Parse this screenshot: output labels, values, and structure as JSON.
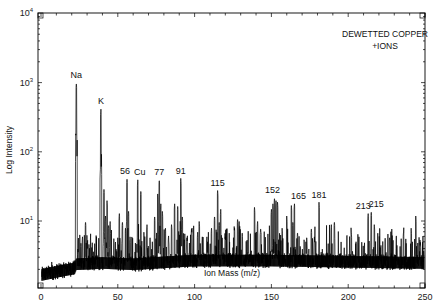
{
  "chart_data": {
    "type": "line",
    "title": "",
    "annotation": [
      "DEWETTED COPPER",
      "+IONS"
    ],
    "xlabel": "Ion Mass (m/z)",
    "ylabel": "Log Intensity",
    "xlim": [
      0,
      250
    ],
    "ylim_log10": [
      0,
      4
    ],
    "yscale": "log",
    "grid": false,
    "legend": null,
    "x_ticks": [
      0,
      50,
      100,
      150,
      200,
      250
    ],
    "x_tick_labels": [
      "0",
      "50",
      "100",
      "150",
      "200",
      "250"
    ],
    "y_ticks": [
      10,
      100,
      1000,
      10000
    ],
    "y_tick_labels": [
      "10¹",
      "10²",
      "10³",
      "10⁴"
    ],
    "baseline": [
      {
        "x": 0,
        "y": 1.6
      },
      {
        "x": 22,
        "y": 2.0
      },
      {
        "x": 23,
        "y": 2.3
      },
      {
        "x": 40,
        "y": 2.4
      },
      {
        "x": 60,
        "y": 2.3
      },
      {
        "x": 100,
        "y": 2.6
      },
      {
        "x": 150,
        "y": 2.6
      },
      {
        "x": 200,
        "y": 2.5
      },
      {
        "x": 250,
        "y": 2.4
      }
    ],
    "labeled_peaks": [
      {
        "label": "Na",
        "x": 23,
        "y": 1000
      },
      {
        "label": "K",
        "x": 39,
        "y": 420
      },
      {
        "label": "56",
        "x": 56,
        "y": 42
      },
      {
        "label": "Cu",
        "x": 63,
        "y": 40
      },
      {
        "label": "77",
        "x": 77,
        "y": 40
      },
      {
        "label": "91",
        "x": 91,
        "y": 42
      },
      {
        "label": "115",
        "x": 115,
        "y": 28
      },
      {
        "label": "152",
        "x": 152,
        "y": 22
      },
      {
        "label": "165",
        "x": 165,
        "y": 18
      },
      {
        "label": "181",
        "x": 181,
        "y": 19
      },
      {
        "label": "213",
        "x": 213,
        "y": 13
      },
      {
        "label": "215",
        "x": 215,
        "y": 14
      }
    ],
    "minor_peaks": [
      {
        "x": 7,
        "y": 2.6
      },
      {
        "x": 24,
        "y": 4.0
      },
      {
        "x": 26,
        "y": 5.0
      },
      {
        "x": 27,
        "y": 6.0
      },
      {
        "x": 29,
        "y": 10.0
      },
      {
        "x": 30,
        "y": 4.5
      },
      {
        "x": 41,
        "y": 30
      },
      {
        "x": 42,
        "y": 12
      },
      {
        "x": 43,
        "y": 20
      },
      {
        "x": 44,
        "y": 9
      },
      {
        "x": 45,
        "y": 10
      },
      {
        "x": 50,
        "y": 6
      },
      {
        "x": 51,
        "y": 13
      },
      {
        "x": 53,
        "y": 10
      },
      {
        "x": 55,
        "y": 8
      },
      {
        "x": 57,
        "y": 14
      },
      {
        "x": 58,
        "y": 6
      },
      {
        "x": 65,
        "y": 28
      },
      {
        "x": 67,
        "y": 7
      },
      {
        "x": 69,
        "y": 9
      },
      {
        "x": 71,
        "y": 6
      },
      {
        "x": 74,
        "y": 12
      },
      {
        "x": 76,
        "y": 25
      },
      {
        "x": 78,
        "y": 18
      },
      {
        "x": 79,
        "y": 14
      },
      {
        "x": 81,
        "y": 8
      },
      {
        "x": 83,
        "y": 6
      },
      {
        "x": 85,
        "y": 9
      },
      {
        "x": 87,
        "y": 18
      },
      {
        "x": 89,
        "y": 17
      },
      {
        "x": 92,
        "y": 12
      },
      {
        "x": 95,
        "y": 6
      },
      {
        "x": 98,
        "y": 8
      },
      {
        "x": 102,
        "y": 7
      },
      {
        "x": 103,
        "y": 10
      },
      {
        "x": 105,
        "y": 6
      },
      {
        "x": 108,
        "y": 6
      },
      {
        "x": 111,
        "y": 8
      },
      {
        "x": 113,
        "y": 12
      },
      {
        "x": 116,
        "y": 10
      },
      {
        "x": 117,
        "y": 15
      },
      {
        "x": 120,
        "y": 6
      },
      {
        "x": 126,
        "y": 8
      },
      {
        "x": 128,
        "y": 11
      },
      {
        "x": 129,
        "y": 10
      },
      {
        "x": 131,
        "y": 7
      },
      {
        "x": 139,
        "y": 16
      },
      {
        "x": 141,
        "y": 10
      },
      {
        "x": 143,
        "y": 8
      },
      {
        "x": 150,
        "y": 15
      },
      {
        "x": 151,
        "y": 18
      },
      {
        "x": 153,
        "y": 20
      },
      {
        "x": 154,
        "y": 19
      },
      {
        "x": 157,
        "y": 8
      },
      {
        "x": 160,
        "y": 12
      },
      {
        "x": 163,
        "y": 17
      },
      {
        "x": 164,
        "y": 10
      },
      {
        "x": 167,
        "y": 7
      },
      {
        "x": 173,
        "y": 6
      },
      {
        "x": 176,
        "y": 8
      },
      {
        "x": 178,
        "y": 6
      },
      {
        "x": 189,
        "y": 9
      },
      {
        "x": 191,
        "y": 10
      },
      {
        "x": 202,
        "y": 7
      },
      {
        "x": 207,
        "y": 6
      },
      {
        "x": 217,
        "y": 9
      },
      {
        "x": 227,
        "y": 6
      },
      {
        "x": 236,
        "y": 7
      },
      {
        "x": 241,
        "y": 8
      },
      {
        "x": 244,
        "y": 12
      },
      {
        "x": 247,
        "y": 5
      }
    ]
  }
}
